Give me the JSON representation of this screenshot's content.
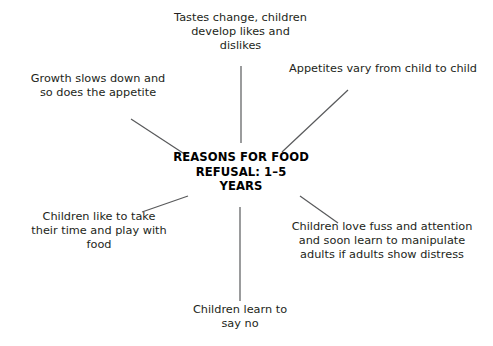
{
  "diagram": {
    "type": "radial-spider",
    "center": {
      "label": "REASONS FOR FOOD\nREFUSAL: 1–5\nYEARS"
    },
    "nodes": [
      {
        "id": "top",
        "label": "Tastes change, children\ndevelop likes and\ndislikes"
      },
      {
        "id": "topright",
        "label": "Appetites vary from child to child"
      },
      {
        "id": "topleft",
        "label": "Growth slows down and\nso does the appetite"
      },
      {
        "id": "bottomleft",
        "label": "Children like to take\ntheir time and play with\nfood"
      },
      {
        "id": "bottomright",
        "label": "Children love fuss and attention\nand soon learn to manipulate\nadults if adults show distress"
      },
      {
        "id": "bottom",
        "label": "Children learn to\nsay no"
      }
    ],
    "connectors": [
      {
        "id": "connector-top",
        "x1": 241,
        "y1": 66,
        "x2": 241,
        "y2": 143
      },
      {
        "id": "connector-topright",
        "x1": 348,
        "y1": 90,
        "x2": 282,
        "y2": 152
      },
      {
        "id": "connector-topleft",
        "x1": 131,
        "y1": 119,
        "x2": 186,
        "y2": 155
      },
      {
        "id": "connector-bottomleft",
        "x1": 142,
        "y1": 212,
        "x2": 188,
        "y2": 196
      },
      {
        "id": "connector-bottomright",
        "x1": 300,
        "y1": 196,
        "x2": 338,
        "y2": 223
      },
      {
        "id": "connector-bottom",
        "x1": 240,
        "y1": 207,
        "x2": 240,
        "y2": 301
      }
    ],
    "colors": {
      "background": "#ffffff",
      "text": "#231f20",
      "center_text": "#000000",
      "connector": "#58595b"
    }
  }
}
